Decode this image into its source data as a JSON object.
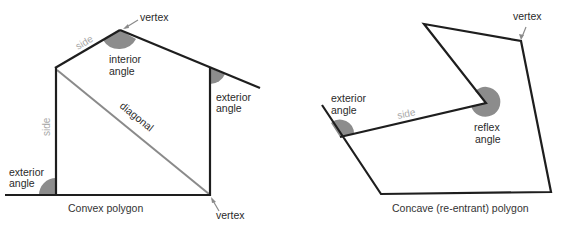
{
  "colors": {
    "line": "#1e1e1e",
    "diagonal": "#8a8a8a",
    "angle_fill": "#8c8c8c",
    "label_text": "#2a2a2a",
    "side_label_text": "#a8a8a8",
    "background": "#ffffff"
  },
  "convex": {
    "caption": "Convex polygon",
    "labels": {
      "vertex_top": "vertex",
      "vertex_bottom": "vertex",
      "side_roof": "side",
      "side_left": "side",
      "interior_angle_line1": "interior",
      "interior_angle_line2": "angle",
      "exterior_right_line1": "exterior",
      "exterior_right_line2": "angle",
      "exterior_left_line1": "exterior",
      "exterior_left_line2": "angle",
      "diagonal": "diagonal"
    }
  },
  "concave": {
    "caption": "Concave (re-entrant) polygon",
    "labels": {
      "vertex": "vertex",
      "exterior_line1": "exterior",
      "exterior_line2": "angle",
      "side": "side",
      "reflex_line1": "reflex",
      "reflex_line2": "angle"
    }
  }
}
